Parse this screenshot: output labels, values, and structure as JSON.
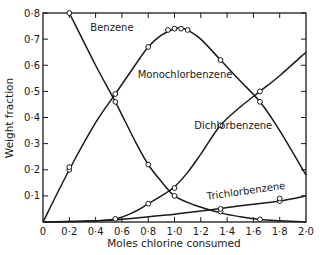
{
  "chart_data": {
    "type": "line",
    "title": "",
    "xlabel": "Moles chlorine consumed",
    "ylabel": "Weight fraction",
    "xlim": [
      0,
      2.0
    ],
    "ylim": [
      0,
      0.8
    ],
    "grid": false,
    "legend": "inline labels on curves",
    "x_ticks": [
      "0",
      "0·2",
      "0·4",
      "0·6",
      "0·8",
      "1·0",
      "1·2",
      "1·4",
      "1·6",
      "1·8",
      "2·0"
    ],
    "y_ticks": [
      "0·1",
      "0·2",
      "0·3",
      "0·4",
      "0·5",
      "0·6",
      "0·7",
      "0·8"
    ],
    "origin_label": "0",
    "series": [
      {
        "name": "Benzene",
        "curve": [
          [
            0.2,
            0.8
          ],
          [
            0.4,
            0.6
          ],
          [
            0.55,
            0.46
          ],
          [
            0.7,
            0.31
          ],
          [
            0.8,
            0.22
          ],
          [
            0.9,
            0.155
          ],
          [
            1.0,
            0.1
          ],
          [
            1.15,
            0.065
          ],
          [
            1.35,
            0.035
          ],
          [
            1.5,
            0.02
          ],
          [
            1.65,
            0.01
          ],
          [
            1.8,
            0.005
          ],
          [
            2.0,
            0.0
          ]
        ],
        "markers": [
          [
            0.2,
            0.8
          ],
          [
            0.55,
            0.46
          ],
          [
            0.8,
            0.22
          ],
          [
            1.0,
            0.1
          ],
          [
            1.35,
            0.04
          ],
          [
            1.65,
            0.01
          ]
        ]
      },
      {
        "name": "Monochlorbenzene",
        "curve": [
          [
            0,
            0
          ],
          [
            0.2,
            0.2
          ],
          [
            0.4,
            0.38
          ],
          [
            0.55,
            0.49
          ],
          [
            0.7,
            0.6
          ],
          [
            0.8,
            0.67
          ],
          [
            0.9,
            0.715
          ],
          [
            1.0,
            0.74
          ],
          [
            1.05,
            0.742
          ],
          [
            1.1,
            0.735
          ],
          [
            1.2,
            0.7
          ],
          [
            1.35,
            0.62
          ],
          [
            1.5,
            0.54
          ],
          [
            1.65,
            0.46
          ],
          [
            1.8,
            0.35
          ],
          [
            2.0,
            0.18
          ]
        ],
        "markers": [
          [
            0.2,
            0.2
          ],
          [
            0.2,
            0.21
          ],
          [
            0.55,
            0.49
          ],
          [
            0.8,
            0.67
          ],
          [
            0.95,
            0.735
          ],
          [
            1.0,
            0.74
          ],
          [
            1.05,
            0.74
          ],
          [
            1.1,
            0.735
          ],
          [
            1.35,
            0.62
          ],
          [
            1.65,
            0.46
          ]
        ]
      },
      {
        "name": "Dichlorbenzene",
        "curve": [
          [
            0,
            0
          ],
          [
            0.3,
            0.003
          ],
          [
            0.55,
            0.012
          ],
          [
            0.7,
            0.04
          ],
          [
            0.8,
            0.07
          ],
          [
            0.9,
            0.1
          ],
          [
            1.0,
            0.135
          ],
          [
            1.1,
            0.19
          ],
          [
            1.2,
            0.26
          ],
          [
            1.35,
            0.37
          ],
          [
            1.5,
            0.44
          ],
          [
            1.65,
            0.5
          ],
          [
            1.8,
            0.56
          ],
          [
            2.0,
            0.65
          ]
        ],
        "markers": [
          [
            0.55,
            0.012
          ],
          [
            0.8,
            0.07
          ],
          [
            1.0,
            0.13
          ],
          [
            1.35,
            0.37
          ],
          [
            1.65,
            0.5
          ]
        ]
      },
      {
        "name": "Trichlorbenzene",
        "curve": [
          [
            0,
            0
          ],
          [
            0.3,
            0.003
          ],
          [
            0.55,
            0.008
          ],
          [
            0.8,
            0.02
          ],
          [
            1.0,
            0.03
          ],
          [
            1.2,
            0.042
          ],
          [
            1.35,
            0.052
          ],
          [
            1.6,
            0.068
          ],
          [
            1.8,
            0.08
          ],
          [
            2.0,
            0.1
          ]
        ],
        "markers": [
          [
            1.35,
            0.05
          ],
          [
            1.8,
            0.08
          ],
          [
            1.8,
            0.09
          ]
        ]
      }
    ],
    "labels": [
      {
        "text": "Benzene",
        "x": 0.36,
        "y": 0.73,
        "rotate": 0
      },
      {
        "text": "Monochlorbenzene",
        "x": 0.72,
        "y": 0.55,
        "rotate": 0
      },
      {
        "text": "Dichlorbenzene",
        "x": 1.15,
        "y": 0.355,
        "rotate": 0
      },
      {
        "text": "Trichlorbenzene",
        "x": 1.25,
        "y": 0.085,
        "rotate": -8
      }
    ]
  }
}
